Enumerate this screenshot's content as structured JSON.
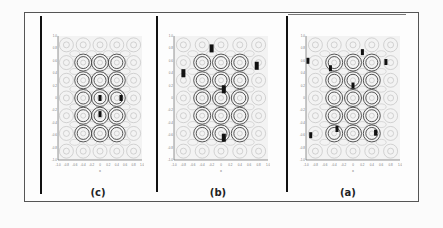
{
  "figure": {
    "panels": [
      {
        "id": "c",
        "label": "(c)",
        "particles": [
          [
            0.5,
            0.5
          ],
          [
            0.75,
            0.5
          ],
          [
            0.5,
            0.63
          ]
        ],
        "cluster": "tight"
      },
      {
        "id": "b",
        "label": "(b)",
        "particles": [
          [
            0.4,
            0.1
          ],
          [
            0.88,
            0.24
          ],
          [
            0.1,
            0.3
          ],
          [
            0.53,
            0.43
          ],
          [
            0.53,
            0.82
          ]
        ],
        "cluster": "scattered"
      },
      {
        "id": "a",
        "label": "(a)",
        "particles": [
          [
            0.6,
            0.13
          ],
          [
            0.02,
            0.2
          ],
          [
            0.26,
            0.26
          ],
          [
            0.85,
            0.21
          ],
          [
            0.5,
            0.4
          ],
          [
            0.33,
            0.75
          ],
          [
            0.05,
            0.8
          ],
          [
            0.74,
            0.78
          ]
        ],
        "cluster": "dispersed"
      }
    ],
    "axis": {
      "x_label": "x",
      "y_label": "y",
      "x_ticks": [
        "-1.0",
        "-0.8",
        "-0.6",
        "-0.4",
        "-0.2",
        "0",
        "0.2",
        "0.4",
        "0.6",
        "0.8",
        "1.0"
      ],
      "y_ticks": [
        "-1.0",
        "-0.8",
        "-0.6",
        "-0.4",
        "-0.2",
        "0",
        "0.2",
        "0.4",
        "0.6",
        "0.8",
        "1.0"
      ]
    },
    "colors": {
      "contour_dark": "#444444",
      "contour_light": "#bbbbbb",
      "particle": "#111111",
      "background": "#f3f3f3"
    }
  }
}
